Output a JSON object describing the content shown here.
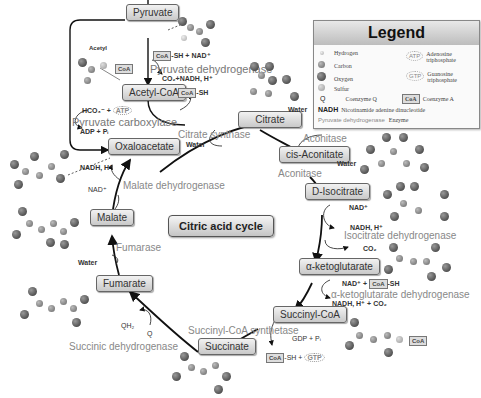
{
  "title": "Citric acid cycle",
  "nodes": {
    "pyruvate": "Pyruvate",
    "acetyl_coa": "Acetyl-CoA",
    "citrate": "Citrate",
    "cis_aconitate": "cis-Aconitate",
    "d_isocitrate": "D-Isocitrate",
    "a_ketoglutarate": "α-ketoglutarate",
    "succinyl_coa": "Succinyl-CoA",
    "succinate": "Succinate",
    "fumarate": "Fumarate",
    "malate": "Malate",
    "oxaloacetate": "Oxaloacetate"
  },
  "enzymes": {
    "pyruvate_dehydrogenase": "Pyruvate dehydrogenase",
    "pyruvate_carboxylase": "Pyruvate carboxylase",
    "citrate_synthase": "Citrate synthase",
    "aconitase_1": "Aconitase",
    "aconitase_2": "Aconitase",
    "isocitrate_dehydrogenase": "Isocitrate dehydrogenase",
    "akg_dehydrogenase": "α-ketoglutarate dehydrogenase",
    "succinyl_coa_synthetase": "Succinyl-CoA synthetase",
    "succinic_dehydrogenase": "Succinic dehydrogenase",
    "fumarase": "Fumarase",
    "malate_dehydrogenase": "Malate dehydrogenase"
  },
  "cofactors": {
    "coa": "CoA",
    "sh_nad": "-SH + NAD⁺",
    "co2_nadh": "CO₂+NADH, H⁺",
    "sh": "-SH",
    "acetyl": "Acetyl",
    "hco3": "HCO₃⁻ +",
    "atp": "ATP",
    "adp_pi": "ADP + Pᵢ",
    "water_citrate": "Water",
    "water_aconitate": "Water",
    "water_isocitrate": "Water",
    "water_fumarate": "Water",
    "nad_isocitrate": "NAD⁺",
    "nadh_isocitrate": "NADH, H⁺",
    "co2_isocitrate": "CO₂",
    "nad_akg": "NAD⁺ +",
    "nadh_akg": "NADH, H⁺ + CO₂",
    "gdp_pi": "GDP + Pᵢ",
    "sh_gtp": "-SH +",
    "gtp": "GTP",
    "qh2": "QH₂",
    "q": "Q",
    "nadh_malate": "NADH, H⁺",
    "nad_malate": "NAD⁺"
  },
  "legend": {
    "title": "Legend",
    "items": [
      {
        "symbol": "hydrogen-atom",
        "label": "Hydrogen"
      },
      {
        "symbol": "carbon-atom",
        "label": "Carbon"
      },
      {
        "symbol": "oxygen-atom",
        "label": "Oxygen"
      },
      {
        "symbol": "sulfur-atom",
        "label": "Sulfur"
      },
      {
        "symbol": "Q",
        "label": "Coenzyme Q"
      },
      {
        "symbol": "NADH",
        "label": "Nicotinamide adenine dinucleotide"
      },
      {
        "symbol": "Pyruvate dehydrogenase",
        "label": "Enzyme"
      },
      {
        "symbol": "ATP",
        "label": "Adenosine triphosphate"
      },
      {
        "symbol": "GTP",
        "label": "Guanosine triphosphate"
      },
      {
        "symbol": "CoA",
        "label": "Coenzyme A"
      }
    ]
  }
}
